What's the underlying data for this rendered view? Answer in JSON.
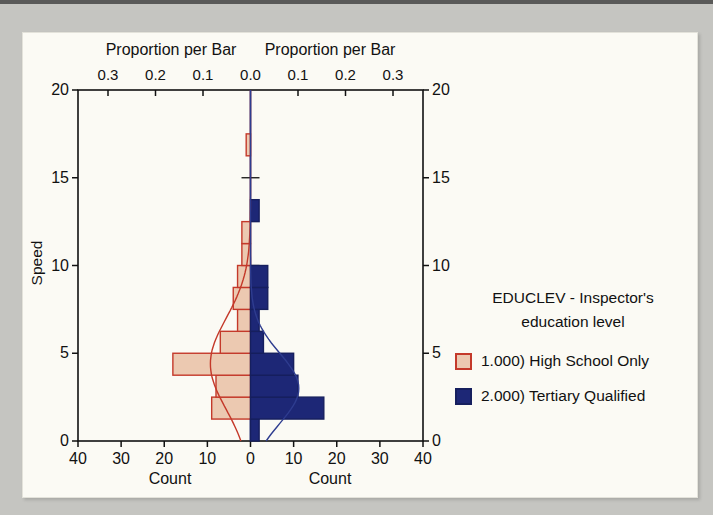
{
  "page": {
    "background_color": "#c5c5c1",
    "panel_color": "#fbfaf4"
  },
  "chart_data": {
    "type": "bar",
    "subtype": "back-to-back horizontal histogram (population pyramid) with normal curves",
    "title": "",
    "y_axis": {
      "label": "Speed",
      "ticks": [
        0,
        5,
        10,
        15,
        20
      ],
      "range": [
        0,
        20
      ]
    },
    "bottom_axis": {
      "label_left": "Count",
      "label_right": "Count",
      "tick_counts": [
        -40,
        -30,
        -20,
        -10,
        0,
        10,
        20,
        30,
        40
      ],
      "tick_labels": [
        "40",
        "30",
        "20",
        "10",
        "0",
        "10",
        "20",
        "30",
        "40"
      ],
      "max_count": 40
    },
    "top_axis": {
      "label_left": "Proportion per Bar",
      "label_right": "Proportion per Bar",
      "tick_proportions": [
        -0.3,
        -0.2,
        -0.1,
        0.0,
        0.1,
        0.2,
        0.3
      ],
      "tick_labels": [
        "0.3",
        "0.2",
        "0.1",
        "0.0",
        "0.1",
        "0.2",
        "0.3"
      ]
    },
    "bin_width": 1.25,
    "series": [
      {
        "name": "1.000) High School Only",
        "side": "left",
        "fill": "#ecc9b1",
        "stroke": "#c4392a",
        "bins": [
          {
            "lo": 1.25,
            "hi": 2.5,
            "count": 9
          },
          {
            "lo": 2.5,
            "hi": 3.75,
            "count": 8
          },
          {
            "lo": 3.75,
            "hi": 5,
            "count": 18
          },
          {
            "lo": 5,
            "hi": 6.25,
            "count": 7
          },
          {
            "lo": 6.25,
            "hi": 7.5,
            "count": 3
          },
          {
            "lo": 7.5,
            "hi": 8.75,
            "count": 4
          },
          {
            "lo": 8.75,
            "hi": 10,
            "count": 3
          },
          {
            "lo": 10,
            "hi": 11.25,
            "count": 2
          },
          {
            "lo": 11.25,
            "hi": 12.5,
            "count": 2
          },
          {
            "lo": 16.25,
            "hi": 17.5,
            "count": 1
          }
        ],
        "curve": {
          "mean": 4.4,
          "sd": 2.6,
          "peak": 9.3,
          "color": "#c4392a"
        }
      },
      {
        "name": "2.000) Tertiary Qualified",
        "side": "right",
        "fill": "#1d2776",
        "stroke": "#161f5e",
        "bins": [
          {
            "lo": 0,
            "hi": 1.25,
            "count": 2
          },
          {
            "lo": 1.25,
            "hi": 2.5,
            "count": 17
          },
          {
            "lo": 2.5,
            "hi": 3.75,
            "count": 11
          },
          {
            "lo": 3.75,
            "hi": 5,
            "count": 10
          },
          {
            "lo": 5,
            "hi": 6.25,
            "count": 3
          },
          {
            "lo": 6.25,
            "hi": 7.5,
            "count": 2
          },
          {
            "lo": 7.5,
            "hi": 8.75,
            "count": 4
          },
          {
            "lo": 8.75,
            "hi": 10,
            "count": 4
          },
          {
            "lo": 12.5,
            "hi": 13.75,
            "count": 2
          }
        ],
        "curve": {
          "mean": 3.0,
          "sd": 2.0,
          "peak": 11.2,
          "color": "#2e3c8f"
        }
      }
    ],
    "legend": {
      "title_line1": "EDUCLEV - Inspector's",
      "title_line2": "education level",
      "items": [
        {
          "label": "1.000) High School Only",
          "fill": "#ecc9b1",
          "stroke": "#c4392a"
        },
        {
          "label": "2.000) Tertiary Qualified",
          "fill": "#1d2776",
          "stroke": "#161f5e"
        }
      ]
    },
    "axis_color": "#111111",
    "grid": false,
    "legend_position": "right"
  }
}
